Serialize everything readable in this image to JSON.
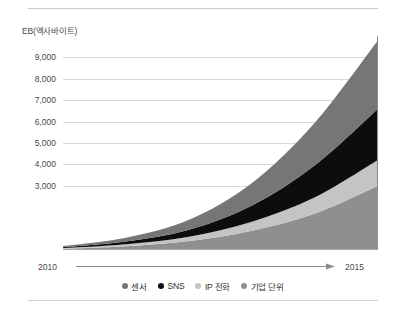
{
  "chart_data": {
    "type": "area",
    "stacked": true,
    "title": "",
    "subtitle": "",
    "xlabel": "",
    "ylabel": "EB(엑사바이트)",
    "unit_label": "EB(엑사바이트)",
    "x": [
      2010,
      2011,
      2012,
      2013,
      2014,
      2015
    ],
    "x_tick_labels": [
      "2010",
      "2015"
    ],
    "x_start_label": "2010",
    "x_end_label": "2015",
    "xlim": [
      2010,
      2015
    ],
    "y_tick_labels": [
      "9,000",
      "8,000",
      "7,000",
      "6,000",
      "5,000",
      "4,000",
      "3,000"
    ],
    "y_ticks": [
      9000,
      8000,
      7000,
      6000,
      5000,
      4000,
      3000
    ],
    "ylim": [
      0,
      10000
    ],
    "grid": true,
    "legend_position": "bottom-center",
    "series": [
      {
        "name": "기업 단위",
        "color": "#8f8f8f",
        "stack_order": 1,
        "values": [
          60,
          180,
          420,
          900,
          1700,
          3000
        ]
      },
      {
        "name": "IP 전화",
        "color": "#c4c4c4",
        "stack_order": 2,
        "values": [
          30,
          90,
          200,
          420,
          760,
          1200
        ]
      },
      {
        "name": "SNS",
        "color": "#0d0d0d",
        "stack_order": 3,
        "values": [
          40,
          130,
          330,
          760,
          1500,
          2400
        ]
      },
      {
        "name": "센서",
        "color": "#767676",
        "stack_order": 4,
        "values": [
          50,
          170,
          460,
          1050,
          2000,
          3200
        ]
      }
    ],
    "stack_totals": [
      180,
      570,
      1410,
      3130,
      5960,
      9800
    ]
  },
  "legend": {
    "items": [
      {
        "label": "센서",
        "color": "#767676"
      },
      {
        "label": "SNS",
        "color": "#0d0d0d"
      },
      {
        "label": "IP 전화",
        "color": "#c4c4c4"
      },
      {
        "label": "기업 단위",
        "color": "#8f8f8f"
      }
    ]
  },
  "colors": {
    "background": "#ffffff",
    "gridline": "#d8d8d8",
    "axis": "#8d8d8d",
    "text": "#4a4a4a",
    "rule": "#c9c9c9"
  }
}
